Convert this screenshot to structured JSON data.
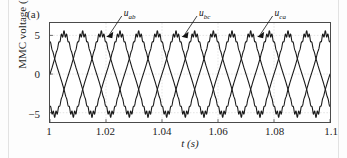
{
  "figure": {
    "panel_label": "(a)",
    "background_color": "#fdfdfd"
  },
  "chart_data": {
    "type": "line",
    "title": "",
    "subtitle": "",
    "panel": "(a)",
    "xlabel": "t (s)",
    "ylabel": "MMC voltage (kV)",
    "xlim": [
      1.0,
      1.1
    ],
    "ylim": [
      -6.2,
      6.6
    ],
    "xticks": [
      1,
      1.02,
      1.04,
      1.06,
      1.08,
      1.1
    ],
    "xtick_labels": [
      "1",
      "1.02",
      "1.04",
      "1.06",
      "1.08",
      "1.1"
    ],
    "yticks": [
      5,
      0,
      -5
    ],
    "ytick_labels": [
      "5",
      "0",
      "−5"
    ],
    "grid": {
      "horizontal": true,
      "vertical": true,
      "color": "#d9d9d9",
      "style": "dotted"
    },
    "legend_position": "inline-annotations",
    "waveform": {
      "shape": "sinusoid",
      "frequency_hz": 50,
      "cycles_shown": 5,
      "amplitude_kv": 4.6,
      "peak_ripple": "flattened peaks with switching ripple",
      "line_color": "#1a1a1a",
      "line_width_px": 1.1
    },
    "series": [
      {
        "name": "u_ab",
        "label": "u",
        "subscript": "ab",
        "phase_deg": 0,
        "amplitude_kv": 4.6,
        "annotation_text_x": 1.0265,
        "annotation_arrow_tip_x": 1.0235,
        "annotation_arrow_tip_y": 4.6
      },
      {
        "name": "u_bc",
        "label": "u",
        "subscript": "bc",
        "phase_deg": -120,
        "amplitude_kv": 4.6,
        "annotation_text_x": 1.0532,
        "annotation_arrow_tip_x": 1.0502,
        "annotation_arrow_tip_y": 4.6
      },
      {
        "name": "u_ca",
        "label": "u",
        "subscript": "ca",
        "phase_deg": -240,
        "amplitude_kv": 4.6,
        "annotation_text_x": 1.08,
        "annotation_arrow_tip_x": 1.077,
        "annotation_arrow_tip_y": 4.6
      }
    ],
    "annotations": [
      {
        "text": "u_ab",
        "label": "u",
        "sub": "ab"
      },
      {
        "text": "u_bc",
        "label": "u",
        "sub": "bc"
      },
      {
        "text": "u_ca",
        "label": "u",
        "sub": "ca"
      }
    ]
  }
}
